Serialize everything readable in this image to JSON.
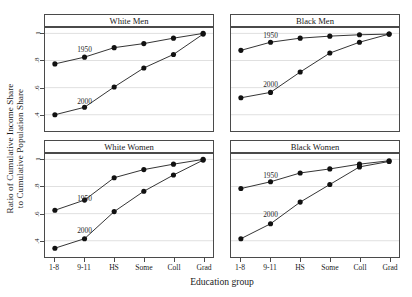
{
  "chart_data": {
    "type": "line",
    "title": "",
    "xlabel": "Education group",
    "ylabel_line1": "Ratio of Cumulative Income Share",
    "ylabel_line2": "to Cumulative Population Share",
    "categories": [
      "1-8",
      "9-11",
      "HS",
      "Some",
      "Coll",
      "Grad"
    ],
    "yticks": [
      "1",
      ".8",
      ".6",
      ".4"
    ],
    "ytick_values": [
      1.0,
      0.8,
      0.6,
      0.4
    ],
    "ylim": [
      0.28,
      1.04
    ],
    "grid": true,
    "legend": "inline-annotations",
    "marker": "filled-circle",
    "panels": [
      {
        "title": "White Men",
        "series": [
          {
            "name": "1950",
            "values": [
              0.775,
              0.825,
              0.895,
              0.925,
              0.965,
              1.0
            ],
            "label_x": "9-11",
            "label_y": 0.885
          },
          {
            "name": "2000",
            "values": [
              0.4,
              0.455,
              0.605,
              0.745,
              0.845,
              0.995
            ],
            "label_x": "9-11",
            "label_y": 0.505
          }
        ]
      },
      {
        "title": "Black Men",
        "series": [
          {
            "name": "1950",
            "values": [
              0.875,
              0.935,
              0.965,
              0.98,
              0.99,
              0.995
            ],
            "label_x": "9-11",
            "label_y": 0.985
          },
          {
            "name": "2000",
            "values": [
              0.525,
              0.565,
              0.715,
              0.855,
              0.935,
              0.995
            ],
            "label_x": "9-11",
            "label_y": 0.625
          }
        ]
      },
      {
        "title": "White Women",
        "series": [
          {
            "name": "1950",
            "values": [
              0.625,
              0.7,
              0.865,
              0.925,
              0.965,
              1.0
            ],
            "label_x": "9-11",
            "label_y": 0.715
          },
          {
            "name": "2000",
            "values": [
              0.345,
              0.415,
              0.615,
              0.765,
              0.885,
              0.995
            ],
            "label_x": "9-11",
            "label_y": 0.48
          }
        ]
      },
      {
        "title": "Black Women",
        "series": [
          {
            "name": "1950",
            "values": [
              0.785,
              0.835,
              0.9,
              0.93,
              0.965,
              0.99
            ],
            "label_x": "9-11",
            "label_y": 0.885
          },
          {
            "name": "2000",
            "values": [
              0.415,
              0.525,
              0.685,
              0.815,
              0.945,
              0.985
            ],
            "label_x": "9-11",
            "label_y": 0.6
          }
        ]
      }
    ]
  },
  "colors": {
    "line": "#1a1a1a",
    "marker": "#111111",
    "grid": "#e0e0e0",
    "frame": "#4a4a4a",
    "text": "#1a1a1a"
  }
}
